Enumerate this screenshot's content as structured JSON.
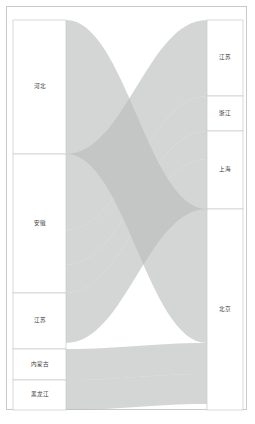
{
  "chart_data": {
    "type": "sankey",
    "title": "",
    "subtitle": "",
    "xlabel": "",
    "ylabel": "",
    "grid": false,
    "legend": "none",
    "orientation": "horizontal",
    "link_color": "#b9bcbc",
    "link_opacity": 0.62,
    "node_fill": "#ffffff",
    "node_stroke": "#c9c9c9",
    "background": "#ffffff",
    "border_color": "#c9c9c9",
    "label_color": "#3a3a3a",
    "source_axis_label": "",
    "target_axis_label": "",
    "nodes_left": [
      {
        "id": "hebei",
        "label": "河北",
        "value": 134,
        "y0": 20,
        "y1": 154
      },
      {
        "id": "anhui",
        "label": "安徽",
        "value": 139,
        "y0": 154,
        "y1": 293
      },
      {
        "id": "jiangsu_s",
        "label": "江苏",
        "value": 56,
        "y0": 293,
        "y1": 349
      },
      {
        "id": "neimenggu",
        "label": "内蒙古",
        "value": 31,
        "y0": 349,
        "y1": 380
      },
      {
        "id": "heilongjiang",
        "label": "黑龙江",
        "value": 30,
        "y0": 380,
        "y1": 410
      }
    ],
    "nodes_right": [
      {
        "id": "jiangsu_t",
        "label": "江苏",
        "value": 76,
        "y0": 20,
        "y1": 96
      },
      {
        "id": "zhejiang",
        "label": "浙江",
        "value": 35,
        "y0": 96,
        "y1": 131
      },
      {
        "id": "shanghai",
        "label": "上海",
        "value": 78,
        "y0": 131,
        "y1": 209
      },
      {
        "id": "beijing",
        "label": "北京",
        "value": 201,
        "y0": 209,
        "y1": 410
      }
    ],
    "links": [
      {
        "source": "河北",
        "target": "北京",
        "value": 134,
        "sy0": 20,
        "sy1": 154,
        "ty0": 209,
        "ty1": 343
      },
      {
        "source": "安徽",
        "target": "江苏",
        "value": 76,
        "sy0": 154,
        "sy1": 230,
        "ty0": 20,
        "ty1": 96
      },
      {
        "source": "安徽",
        "target": "浙江",
        "value": 35,
        "sy0": 230,
        "sy1": 265,
        "ty0": 96,
        "ty1": 131
      },
      {
        "source": "安徽",
        "target": "上海",
        "value": 28,
        "sy0": 265,
        "sy1": 293,
        "ty0": 131,
        "ty1": 159
      },
      {
        "source": "江苏",
        "target": "上海",
        "value": 50,
        "sy0": 293,
        "sy1": 343,
        "ty0": 159,
        "ty1": 209
      },
      {
        "source": "内蒙古",
        "target": "北京",
        "value": 31,
        "sy0": 349,
        "sy1": 380,
        "ty0": 343,
        "ty1": 374
      },
      {
        "source": "黑龙江",
        "target": "北京",
        "value": 30,
        "sy0": 380,
        "sy1": 410,
        "ty0": 374,
        "ty1": 404
      }
    ],
    "node_x_left": 13,
    "node_x_left_w": 53,
    "node_x_right": 207,
    "node_x_right_w": 36
  }
}
